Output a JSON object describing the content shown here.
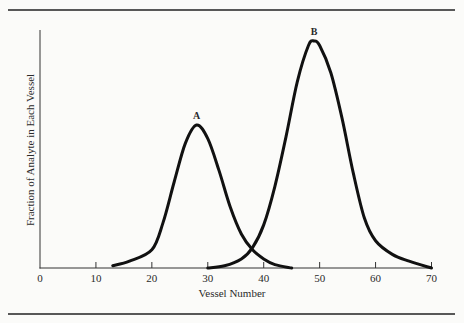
{
  "chart_data": {
    "type": "line",
    "title": "",
    "xlabel": "Vessel Number",
    "ylabel": "Fraction of Analyte in Each Vessel",
    "xlim": [
      0,
      70
    ],
    "ylim": [
      0,
      1
    ],
    "xticks": [
      "0",
      "10",
      "20",
      "30",
      "40",
      "50",
      "60",
      "70"
    ],
    "yticks": [],
    "grid": false,
    "legend": "none",
    "series": [
      {
        "name": "A",
        "peak_vessel": 28,
        "peak_fraction": 0.63,
        "x": [
          13,
          16,
          20,
          22,
          24,
          26,
          28,
          30,
          32,
          34,
          36,
          38,
          40,
          42,
          45
        ],
        "values": [
          0.01,
          0.03,
          0.08,
          0.2,
          0.38,
          0.55,
          0.63,
          0.57,
          0.43,
          0.27,
          0.15,
          0.08,
          0.04,
          0.015,
          0.0
        ]
      },
      {
        "name": "B",
        "peak_vessel": 49,
        "peak_fraction": 1.0,
        "x": [
          30,
          33,
          36,
          38,
          40,
          42,
          44,
          46,
          48,
          49,
          50,
          52,
          54,
          56,
          58,
          60,
          63,
          66,
          70
        ],
        "values": [
          0.0,
          0.01,
          0.04,
          0.09,
          0.19,
          0.36,
          0.58,
          0.82,
          0.98,
          1.0,
          0.98,
          0.86,
          0.66,
          0.42,
          0.22,
          0.12,
          0.06,
          0.03,
          0.0
        ]
      }
    ],
    "annotations": [
      {
        "text": "A",
        "x": 28,
        "y": 0.63
      },
      {
        "text": "B",
        "x": 49,
        "y": 1.0
      }
    ]
  }
}
